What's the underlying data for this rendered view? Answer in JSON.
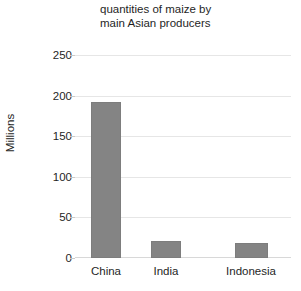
{
  "chart_data": {
    "type": "bar",
    "title": "quantities of maize by\nmain Asian producers",
    "title_line1": "quantities of maize by",
    "title_line2": "main Asian producers",
    "xlabel": "",
    "ylabel": "Millions",
    "categories": [
      "China",
      "India",
      "Indonesia"
    ],
    "values": [
      192,
      21,
      18
    ],
    "ylim": [
      0,
      250
    ],
    "yticks": [
      0,
      50,
      100,
      150,
      200,
      250
    ],
    "ytick_labels": [
      "0",
      "50",
      "100",
      "150",
      "200",
      "250"
    ],
    "grid": true,
    "legend": false,
    "series": [
      {
        "name": "quantity",
        "values": [
          192,
          21,
          18
        ]
      }
    ],
    "colors": {
      "bar_fill": "#848484",
      "bar_stroke": "#7d7d7d",
      "gridline": "#e6e6e6",
      "axis_line": "#d8d8d8",
      "text": "#1f1f1f",
      "background": "#ffffff"
    }
  }
}
